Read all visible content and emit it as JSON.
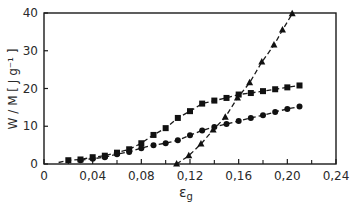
{
  "chart_data": {
    "type": "scatter",
    "title": "",
    "xlabel": "εg",
    "xlabel_main": "ε",
    "xlabel_sub": "g",
    "ylabel": "W / M [ J g⁻¹ ]",
    "xlim": [
      0,
      0.24
    ],
    "ylim": [
      0,
      40
    ],
    "grid": false,
    "legend": null,
    "x_ticks": [
      0,
      0.04,
      0.08,
      0.12,
      0.16,
      0.2,
      0.24
    ],
    "x_tick_labels": [
      "0",
      "0,04",
      "0,08",
      "0,12",
      "0,16",
      "0,20",
      "0,24"
    ],
    "x_minor_ticks": [
      0.02,
      0.06,
      0.1,
      0.14,
      0.18,
      0.22
    ],
    "y_ticks": [
      0,
      10,
      20,
      30,
      40
    ],
    "y_tick_labels": [
      "0",
      "10",
      "20",
      "30",
      "40"
    ],
    "series": [
      {
        "name": "squares",
        "marker": "square",
        "line": "dashed",
        "fit_line_x": [
          0.015,
          0.212
        ],
        "x": [
          0.02,
          0.03,
          0.04,
          0.05,
          0.06,
          0.07,
          0.08,
          0.09,
          0.1,
          0.11,
          0.12,
          0.13,
          0.14,
          0.15,
          0.16,
          0.17,
          0.18,
          0.19,
          0.2,
          0.21
        ],
        "y": [
          1.0,
          1.2,
          1.8,
          2.2,
          3.0,
          3.9,
          5.5,
          7.7,
          9.5,
          12.2,
          14.0,
          16.0,
          16.8,
          17.5,
          18.4,
          18.8,
          19.3,
          19.8,
          20.3,
          20.8
        ]
      },
      {
        "name": "circles",
        "marker": "circle",
        "line": "dashed",
        "x": [
          0.03,
          0.04,
          0.05,
          0.06,
          0.07,
          0.08,
          0.09,
          0.1,
          0.11,
          0.12,
          0.13,
          0.14,
          0.15,
          0.16,
          0.17,
          0.18,
          0.19,
          0.2,
          0.21
        ],
        "y": [
          1.0,
          1.4,
          1.8,
          2.6,
          3.2,
          4.2,
          5.0,
          5.5,
          6.3,
          7.6,
          8.9,
          9.8,
          10.6,
          11.4,
          12.2,
          12.9,
          13.8,
          14.6,
          15.2
        ]
      },
      {
        "name": "triangles",
        "marker": "triangle",
        "line": "dashed",
        "x": [
          0.109,
          0.119,
          0.129,
          0.139,
          0.149,
          0.159,
          0.169,
          0.179,
          0.189,
          0.196,
          0.204
        ],
        "y": [
          0.0,
          2.2,
          5.3,
          9.0,
          12.4,
          17.5,
          21.5,
          27.0,
          31.5,
          35.5,
          39.8
        ]
      }
    ]
  }
}
